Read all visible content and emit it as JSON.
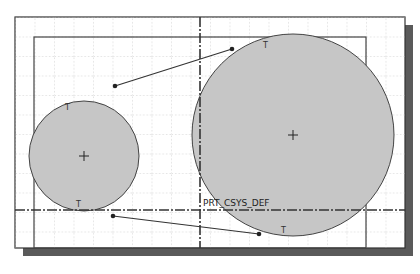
{
  "canvas": {
    "width": 420,
    "height": 274,
    "background": "#ffffff",
    "frame_color": "#333333",
    "shadow_color": "#555555",
    "grid_color": "#b0b0b0",
    "fill_color": "#c8c8c8"
  },
  "labels": {
    "csys": "PRT_CSYS_DEF",
    "tangent_marker": "T"
  },
  "sketch": {
    "circles": [
      {
        "name": "small-circle",
        "cx": 84,
        "cy": 156,
        "r": 55
      },
      {
        "name": "large-circle",
        "cx": 293,
        "cy": 135,
        "r": 101
      }
    ],
    "lines": [
      {
        "name": "upper-tangent-line",
        "x1": 115,
        "y1": 86,
        "x2": 232,
        "y2": 49
      },
      {
        "name": "lower-tangent-line",
        "x1": 113,
        "y1": 216,
        "x2": 259,
        "y2": 234
      }
    ]
  }
}
